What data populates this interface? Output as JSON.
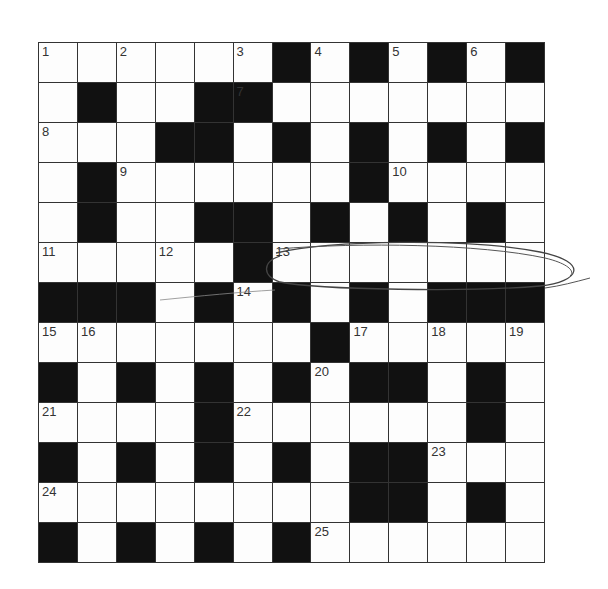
{
  "puzzle": {
    "rows": 13,
    "cols": 13,
    "layout": [
      "111111010101010",
      "1011001111111",
      "1110010101010",
      "1011111101111",
      "1011001010101",
      "1111101111111",
      "0001010101000",
      "1111111011111",
      "0101010100101",
      "1111011111101",
      "0101010100111",
      "1111111100101",
      "0101010111111"
    ],
    "grid": [
      "1111110101010",
      "1011001111111",
      "1110010101010",
      "1011111101111",
      "1011001010101",
      "1111101111111",
      "0001010101000",
      "1111111011111",
      "0101010100101",
      "1111011111101",
      "0101010100111",
      "1111111100101",
      "0101010111111"
    ],
    "numbers": [
      {
        "n": "1",
        "r": 0,
        "c": 0
      },
      {
        "n": "2",
        "r": 0,
        "c": 2
      },
      {
        "n": "3",
        "r": 0,
        "c": 5
      },
      {
        "n": "4",
        "r": 0,
        "c": 7
      },
      {
        "n": "5",
        "r": 0,
        "c": 9
      },
      {
        "n": "6",
        "r": 0,
        "c": 11
      },
      {
        "n": "7",
        "r": 1,
        "c": 5
      },
      {
        "n": "8",
        "r": 2,
        "c": 0
      },
      {
        "n": "9",
        "r": 3,
        "c": 2
      },
      {
        "n": "10",
        "r": 3,
        "c": 9
      },
      {
        "n": "11",
        "r": 5,
        "c": 0
      },
      {
        "n": "12",
        "r": 5,
        "c": 3
      },
      {
        "n": "13",
        "r": 5,
        "c": 6
      },
      {
        "n": "14",
        "r": 6,
        "c": 5
      },
      {
        "n": "15",
        "r": 7,
        "c": 0
      },
      {
        "n": "16",
        "r": 7,
        "c": 1
      },
      {
        "n": "17",
        "r": 7,
        "c": 8
      },
      {
        "n": "18",
        "r": 7,
        "c": 10
      },
      {
        "n": "19",
        "r": 7,
        "c": 12
      },
      {
        "n": "20",
        "r": 8,
        "c": 7
      },
      {
        "n": "21",
        "r": 9,
        "c": 0
      },
      {
        "n": "22",
        "r": 9,
        "c": 5
      },
      {
        "n": "23",
        "r": 10,
        "c": 10
      },
      {
        "n": "24",
        "r": 11,
        "c": 0
      },
      {
        "n": "25",
        "r": 12,
        "c": 7
      }
    ],
    "annotation": {
      "type": "hand-drawn-ellipse",
      "around": "13-across",
      "color": "#444444"
    },
    "colors": {
      "black_cell": "#111111",
      "white_cell": "#fdfdfd",
      "grid_line": "#333333"
    }
  }
}
